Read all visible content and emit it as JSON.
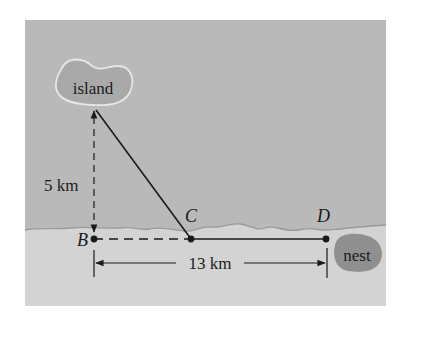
{
  "figure": {
    "colors": {
      "background": "#ffffff",
      "sea": "#b9b9b9",
      "land": "#d3d3d3",
      "shoreline": "#9a9a9a",
      "island_fill": "#a9a9a9",
      "island_outline": "#e6e6e6",
      "nest_fill": "#8f8f8f",
      "ink": "#1a1a1a"
    },
    "island": {
      "label": "island"
    },
    "nest": {
      "label": "nest"
    },
    "points": [
      {
        "id": "B",
        "label": "B"
      },
      {
        "id": "C",
        "label": "C"
      },
      {
        "id": "D",
        "label": "D"
      }
    ],
    "dimensions": {
      "vertical": {
        "label": "5 km",
        "from": "B",
        "to": "island"
      },
      "horizontal": {
        "label": "13 km",
        "from": "B",
        "to": "D"
      }
    },
    "segments": [
      {
        "from": "island",
        "to": "C",
        "style": "solid"
      },
      {
        "from": "B",
        "to": "C",
        "style": "dashed"
      },
      {
        "from": "C",
        "to": "D",
        "style": "solid"
      },
      {
        "from": "B",
        "to": "island",
        "style": "dashed"
      }
    ]
  }
}
